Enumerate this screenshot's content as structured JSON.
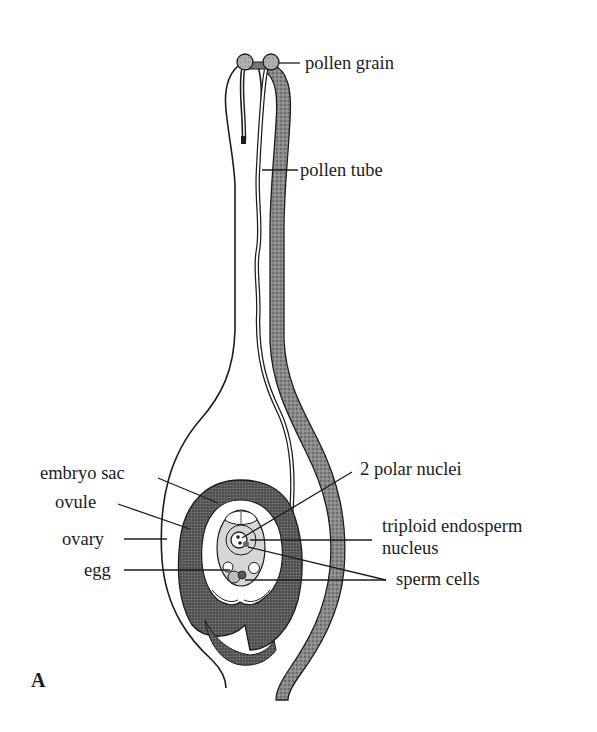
{
  "figure": {
    "panel_label": "A",
    "labels": {
      "pollen_grain": "pollen grain",
      "pollen_tube": "pollen tube",
      "embryo_sac": "embryo sac",
      "ovule": "ovule",
      "ovary": "ovary",
      "egg": "egg",
      "polar_nuclei": "2 polar nuclei",
      "endosperm_line1": "triploid endosperm",
      "endosperm_line2": "nucleus",
      "sperm_cells": "sperm cells"
    },
    "colors": {
      "ink": "#1c1c1c",
      "stipple_dark": "#6e6e6e",
      "stipple_mid": "#9a9a9a",
      "embryo_sac_fill": "#d6d6d6",
      "background": "#ffffff"
    }
  }
}
